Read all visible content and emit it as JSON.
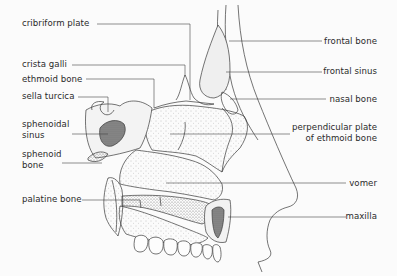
{
  "figure": {
    "colors": {
      "line": "#3a3a3a",
      "stipple": "#7a7a7a",
      "background": "#fbfbfb"
    }
  },
  "labels_left": [
    {
      "id": "cribriform-plate",
      "text": "cribriform plate"
    },
    {
      "id": "crista-galli",
      "text": "crista galli"
    },
    {
      "id": "ethmoid-bone",
      "text": "ethmoid bone"
    },
    {
      "id": "sella-turcica",
      "text": "sella turcica"
    },
    {
      "id": "sphenoidal-sinus",
      "line1": "sphenoidal",
      "line2": "sinus"
    },
    {
      "id": "sphenoid-bone",
      "line1": "sphenoid",
      "line2": "bone"
    },
    {
      "id": "palatine-bone",
      "text": "palatine bone"
    }
  ],
  "labels_right": [
    {
      "id": "frontal-bone",
      "text": "frontal bone"
    },
    {
      "id": "frontal-sinus",
      "text": "frontal sinus"
    },
    {
      "id": "nasal-bone",
      "text": "nasal bone"
    },
    {
      "id": "perpendicular-plate",
      "line1": "perpendicular plate",
      "line2": "of ethmoid bone"
    },
    {
      "id": "vomer",
      "text": "vomer"
    },
    {
      "id": "maxilla",
      "text": "maxilla"
    }
  ]
}
